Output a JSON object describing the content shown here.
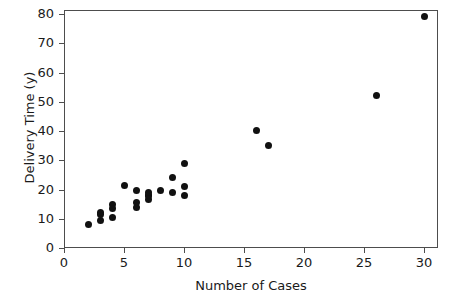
{
  "chart_data": {
    "type": "scatter",
    "title": "",
    "xlabel": "Number of Cases",
    "ylabel": "Delivery Time (y)",
    "xlim": [
      -1,
      31.5
    ],
    "ylim": [
      -2,
      83
    ],
    "grid": false,
    "legend": false,
    "xticks": [
      0,
      5,
      10,
      15,
      20,
      25,
      30
    ],
    "yticks": [
      0,
      10,
      20,
      30,
      40,
      50,
      60,
      70,
      80
    ],
    "xticklabels": [
      "0",
      "5",
      "10",
      "15",
      "20",
      "25",
      "30"
    ],
    "yticklabels": [
      "0",
      "10",
      "20",
      "30",
      "40",
      "50",
      "60",
      "70",
      "80"
    ],
    "marker": {
      "shape": "circle",
      "color": "#111111",
      "size_px": 7
    },
    "x": [
      7,
      3,
      3,
      4,
      6,
      7,
      2,
      7,
      30,
      5,
      16,
      10,
      4,
      6,
      9,
      10,
      6,
      7,
      3,
      17,
      10,
      26,
      9,
      8,
      4
    ],
    "y": [
      16.7,
      11.5,
      12.0,
      14.9,
      13.8,
      18.1,
      8.0,
      17.8,
      79.2,
      21.5,
      40.3,
      21.0,
      13.5,
      19.8,
      24.0,
      29.0,
      15.4,
      19.0,
      9.5,
      35.1,
      17.8,
      52.0,
      19.0,
      19.8,
      10.4
    ],
    "n_points": 25
  },
  "axes": {
    "x_title": "Number of Cases",
    "y_title": "Delivery Time (y)"
  }
}
